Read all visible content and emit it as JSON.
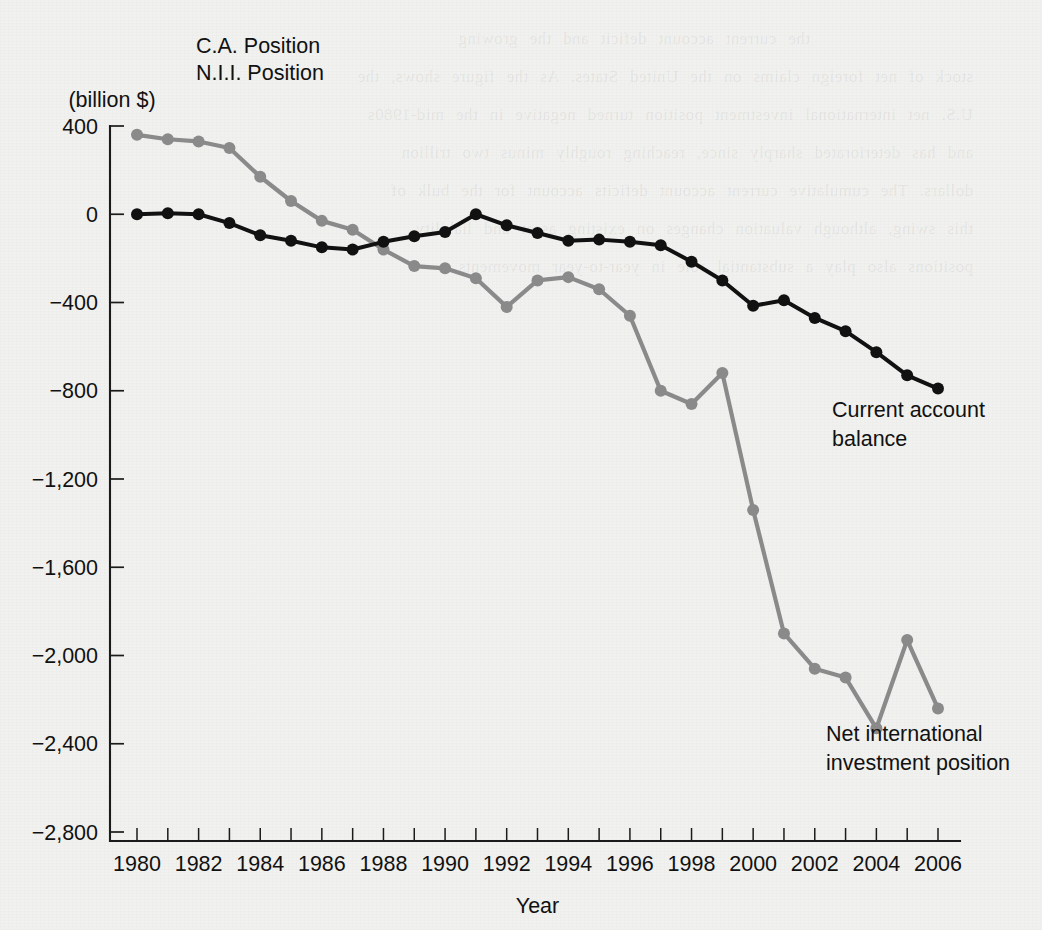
{
  "figure": {
    "background_color": "#f1f1ef",
    "ink_color": "#111111",
    "corner_label_lines": [
      "C.A. Position",
      "N.I.I. Position",
      "(billion $)"
    ]
  },
  "annotations": {
    "current_account": [
      "Current account",
      "balance"
    ],
    "niip": [
      "Net international",
      "investment position"
    ]
  },
  "chart_data": {
    "type": "line",
    "title": "",
    "subtitle": "",
    "xlabel": "Year",
    "ylabel": "C.A. Position  N.I.I. Position  (billion $)",
    "xlim": [
      1979.3,
      2006.9
    ],
    "ylim": [
      -2800,
      400
    ],
    "xticks": [
      1980,
      1981,
      1982,
      1983,
      1984,
      1985,
      1986,
      1987,
      1988,
      1989,
      1990,
      1991,
      1992,
      1993,
      1994,
      1995,
      1996,
      1997,
      1998,
      1999,
      2000,
      2001,
      2002,
      2003,
      2004,
      2005,
      2006
    ],
    "xtick_labels": [
      "1980",
      "",
      "1982",
      "",
      "1984",
      "",
      "1986",
      "",
      "1988",
      "",
      "1990",
      "",
      "1992",
      "",
      "1994",
      "",
      "1996",
      "",
      "1998",
      "",
      "2000",
      "",
      "2002",
      "",
      "2004",
      "",
      "2006"
    ],
    "yticks": [
      400,
      0,
      -400,
      -800,
      -1200,
      -1600,
      -2000,
      -2400,
      -2800
    ],
    "ytick_labels": [
      "400",
      "0",
      "−400",
      "−800",
      "−1,200",
      "−1,600",
      "−2,000",
      "−2,400",
      "−2,800"
    ],
    "grid": false,
    "legend_position": "inline-annotation",
    "x": [
      1980,
      1981,
      1982,
      1983,
      1984,
      1985,
      1986,
      1987,
      1988,
      1989,
      1990,
      1991,
      1992,
      1993,
      1994,
      1995,
      1996,
      1997,
      1998,
      1999,
      2000,
      2001,
      2002,
      2003,
      2004,
      2005,
      2006
    ],
    "series": [
      {
        "name": "Net international investment position",
        "color": "#8a8a8a",
        "marker": "circle",
        "values": [
          360,
          340,
          330,
          300,
          170,
          60,
          -30,
          -70,
          -160,
          -235,
          -245,
          -290,
          -420,
          -300,
          -285,
          -340,
          -460,
          -800,
          -860,
          -720,
          -1340,
          -1900,
          -2060,
          -2100,
          -2330,
          -1930,
          -2240
        ]
      },
      {
        "name": "Current account balance",
        "color": "#111111",
        "marker": "circle",
        "values": [
          0,
          5,
          0,
          -40,
          -95,
          -120,
          -150,
          -160,
          -125,
          -100,
          -80,
          0,
          -50,
          -85,
          -120,
          -115,
          -125,
          -140,
          -215,
          -300,
          -415,
          -390,
          -470,
          -530,
          -625,
          -730,
          -790
        ]
      }
    ]
  }
}
